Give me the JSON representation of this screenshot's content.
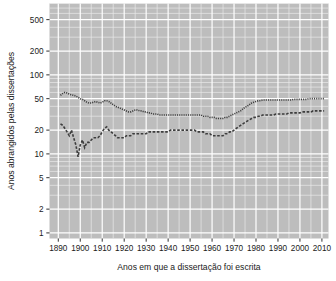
{
  "chart_data": {
    "type": "line",
    "title": "",
    "xlabel": "Anos em que a dissertação foi escrita",
    "ylabel": "Anos abrangidos pelas dissertações",
    "yscale": "log",
    "xlim": [
      1886,
      2013
    ],
    "ylim": [
      0.85,
      800
    ],
    "grid": true,
    "legend": "none",
    "panel_background": "#bdbdbd",
    "gridline_major_color": "#ffffff",
    "gridline_minor_color": "#eaeaea",
    "series_color": "#3d3d3d",
    "xticks": [
      1890,
      1900,
      1910,
      1920,
      1930,
      1940,
      1950,
      1960,
      1970,
      1980,
      1990,
      2000,
      2010
    ],
    "xtick_labels": [
      "1890",
      "1900",
      "1910",
      "1920",
      "1930",
      "1940",
      "1950",
      "1960",
      "1970",
      "1980",
      "1990",
      "2000",
      "2010"
    ],
    "yticks": [
      1,
      2,
      5,
      10,
      20,
      50,
      100,
      200,
      500
    ],
    "ytick_labels": [
      "1",
      "2",
      "5",
      "10",
      "20",
      "50",
      "100",
      "200",
      "500"
    ],
    "series": [
      {
        "name": "upper",
        "style": "dotted",
        "x": [
          1891,
          1892,
          1893,
          1894,
          1895,
          1896,
          1897,
          1898,
          1899,
          1900,
          1901,
          1902,
          1903,
          1904,
          1905,
          1906,
          1907,
          1908,
          1909,
          1910,
          1911,
          1912,
          1913,
          1914,
          1915,
          1916,
          1917,
          1918,
          1919,
          1920,
          1921,
          1922,
          1923,
          1924,
          1925,
          1926,
          1927,
          1928,
          1929,
          1930,
          1931,
          1932,
          1933,
          1934,
          1935,
          1936,
          1937,
          1938,
          1939,
          1940,
          1941,
          1942,
          1943,
          1944,
          1945,
          1946,
          1947,
          1948,
          1949,
          1950,
          1951,
          1952,
          1953,
          1954,
          1955,
          1956,
          1957,
          1958,
          1959,
          1960,
          1961,
          1962,
          1963,
          1964,
          1965,
          1966,
          1967,
          1968,
          1969,
          1970,
          1971,
          1972,
          1973,
          1974,
          1975,
          1976,
          1977,
          1978,
          1979,
          1980,
          1981,
          1982,
          1983,
          1984,
          1985,
          1986,
          1987,
          1988,
          1989,
          1990,
          1991,
          1992,
          1993,
          1994,
          1995,
          1996,
          1997,
          1998,
          1999,
          2000,
          2001,
          2002,
          2003,
          2004,
          2005,
          2006,
          2007,
          2008,
          2009,
          2010,
          2011
        ],
        "y": [
          55,
          58,
          60,
          59,
          57,
          56,
          55,
          54,
          52,
          50,
          49,
          47,
          45,
          44,
          44,
          45,
          46,
          45,
          44,
          45,
          47,
          47,
          46,
          44,
          42,
          40,
          39,
          38,
          37,
          36,
          35,
          34,
          34,
          35,
          36,
          36,
          35,
          35,
          34,
          34,
          33,
          33,
          32,
          32,
          32,
          31,
          31,
          31,
          31,
          31,
          31,
          31,
          31,
          31,
          31,
          31,
          31,
          31,
          31,
          31,
          31,
          31,
          31,
          31,
          31,
          30,
          30,
          30,
          29,
          29,
          29,
          28,
          28,
          28,
          28,
          29,
          29,
          30,
          31,
          32,
          33,
          34,
          35,
          37,
          39,
          40,
          42,
          44,
          45,
          46,
          47,
          47,
          48,
          48,
          48,
          48,
          48,
          48,
          48,
          48,
          48,
          48,
          48,
          48,
          48,
          48,
          49,
          49,
          49,
          49,
          49,
          49,
          49,
          50,
          50,
          50,
          50,
          50,
          50,
          50,
          50
        ]
      },
      {
        "name": "lower",
        "style": "dashed",
        "x": [
          1891,
          1892,
          1893,
          1894,
          1895,
          1896,
          1897,
          1898,
          1899,
          1900,
          1901,
          1902,
          1903,
          1904,
          1905,
          1906,
          1907,
          1908,
          1909,
          1910,
          1911,
          1912,
          1913,
          1914,
          1915,
          1916,
          1917,
          1918,
          1919,
          1920,
          1921,
          1922,
          1923,
          1924,
          1925,
          1926,
          1927,
          1928,
          1929,
          1930,
          1931,
          1932,
          1933,
          1934,
          1935,
          1936,
          1937,
          1938,
          1939,
          1940,
          1941,
          1942,
          1943,
          1944,
          1945,
          1946,
          1947,
          1948,
          1949,
          1950,
          1951,
          1952,
          1953,
          1954,
          1955,
          1956,
          1957,
          1958,
          1959,
          1960,
          1961,
          1962,
          1963,
          1964,
          1965,
          1966,
          1967,
          1968,
          1969,
          1970,
          1971,
          1972,
          1973,
          1974,
          1975,
          1976,
          1977,
          1978,
          1979,
          1980,
          1981,
          1982,
          1983,
          1984,
          1985,
          1986,
          1987,
          1988,
          1989,
          1990,
          1991,
          1992,
          1993,
          1994,
          1995,
          1996,
          1997,
          1998,
          1999,
          2000,
          2001,
          2002,
          2003,
          2004,
          2005,
          2006,
          2007,
          2008,
          2009,
          2010,
          2011
        ],
        "y": [
          24,
          23,
          21,
          19,
          17,
          20,
          16,
          13,
          9.2,
          13,
          15,
          12,
          14,
          14,
          15,
          16,
          16,
          16,
          17,
          19,
          21,
          22,
          20,
          19,
          18,
          17,
          16,
          16,
          16,
          16,
          17,
          17,
          17,
          18,
          18,
          18,
          18,
          18,
          18,
          18,
          19,
          19,
          19,
          19,
          19,
          19,
          19,
          19,
          19,
          19,
          20,
          20,
          20,
          20,
          20,
          20,
          20,
          20,
          20,
          20,
          20,
          20,
          19,
          19,
          19,
          19,
          18,
          18,
          18,
          17,
          17,
          17,
          17,
          17,
          17,
          18,
          18,
          19,
          19,
          20,
          21,
          22,
          23,
          24,
          25,
          26,
          27,
          28,
          29,
          29,
          30,
          30,
          31,
          31,
          31,
          31,
          31,
          31,
          32,
          32,
          32,
          32,
          32,
          32,
          33,
          33,
          33,
          33,
          33,
          33,
          34,
          34,
          34,
          34,
          34,
          35,
          35,
          35,
          35,
          35,
          35
        ]
      }
    ]
  }
}
